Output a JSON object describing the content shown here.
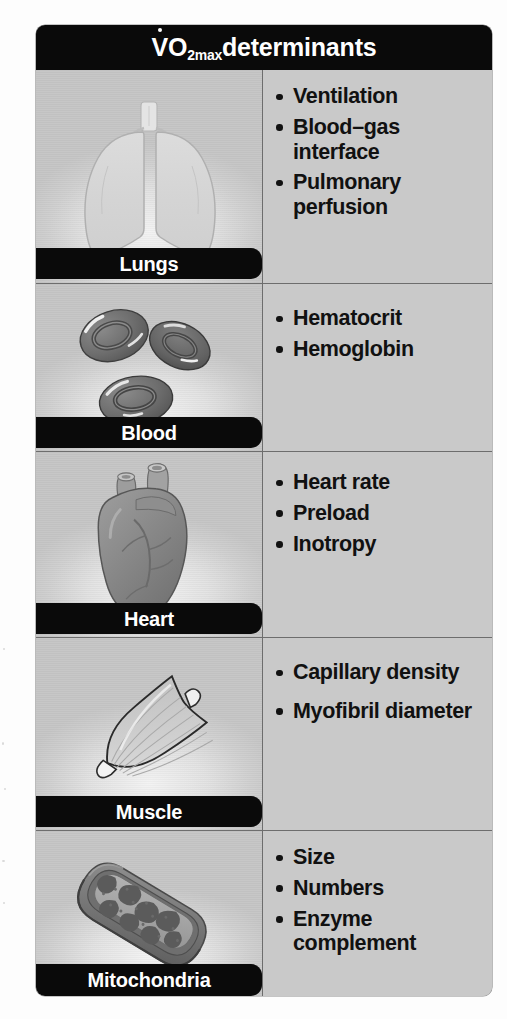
{
  "header": {
    "title_prefix": "V",
    "title_o": "O",
    "title_sub": "2max",
    "title_suffix": " determinants",
    "title_full": "V̇O2max determinants"
  },
  "colors": {
    "bar_black": "#0a0a0a",
    "panel_gray": "#c9c9c9",
    "image_panel_light": "#e2e2e2",
    "text_black": "#111111",
    "border_gray": "#6d6d6d",
    "page_white": "#ffffff"
  },
  "rows": [
    {
      "label": "Lungs",
      "icon": "lungs-illustration",
      "bullets": [
        "Ventilation",
        "Blood–gas interface",
        "Pulmonary perfusion"
      ]
    },
    {
      "label": "Blood",
      "icon": "red-blood-cells-illustration",
      "bullets": [
        "Hematocrit",
        "Hemoglobin"
      ]
    },
    {
      "label": "Heart",
      "icon": "heart-illustration",
      "bullets": [
        "Heart rate",
        "Preload",
        "Inotropy"
      ]
    },
    {
      "label": "Muscle",
      "icon": "skeletal-muscle-illustration",
      "bullets": [
        "Capillary density",
        "Myofibril diameter"
      ]
    },
    {
      "label": "Mitochondria",
      "icon": "mitochondrion-illustration",
      "bullets": [
        "Size",
        "Numbers",
        "Enzyme complement"
      ]
    }
  ]
}
